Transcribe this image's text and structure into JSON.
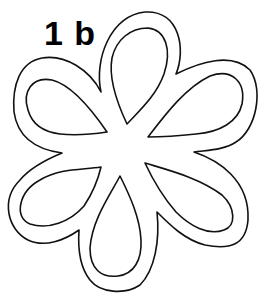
{
  "figure": {
    "label": "1 b",
    "stroke_color": "#111111",
    "background": "#ffffff",
    "petal_count": 6
  }
}
